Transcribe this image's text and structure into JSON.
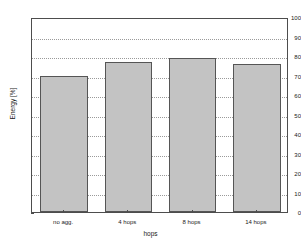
{
  "chart_data": {
    "type": "bar",
    "title": "",
    "xlabel": "hops",
    "ylabel": "Energy [%]",
    "categories": [
      "no agg.",
      "4 hops",
      "8 hops",
      "14 hops"
    ],
    "values": [
      70,
      77,
      79,
      76
    ],
    "ylim": [
      0,
      100
    ],
    "yticks": [
      0,
      10,
      20,
      30,
      40,
      50,
      60,
      70,
      80,
      90,
      100
    ],
    "ytick_labels": [
      "0",
      "10",
      "20",
      "30",
      "40",
      "50",
      "60",
      "70",
      "80",
      "90",
      "100"
    ],
    "grid": true,
    "grid_axis": "y",
    "grid_style": "dotted",
    "legend": null,
    "bar_color": "#c3c3c3",
    "bar_edge_color": "#555555",
    "axis_color": "#4d4d4d",
    "grid_color": "#9a9a9a",
    "background_color": "#ffffff"
  }
}
